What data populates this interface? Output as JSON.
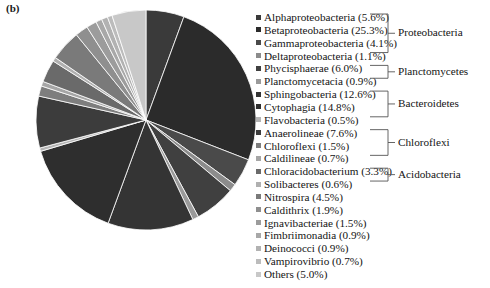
{
  "panel": {
    "label": "(b)"
  },
  "chart_data": {
    "type": "pie",
    "title": "",
    "subtitle": "",
    "xlabel": "",
    "ylabel": "",
    "grid": false,
    "legend_position": "right",
    "start_angle_deg": 0,
    "direction": "clockwise",
    "units": "percent",
    "categories": [
      "Alphaproteobacteria",
      "Betaproteobacteria",
      "Gammaproteobacteria",
      "Deltaproteobacteria",
      "Phycisphaerae",
      "Planctomycetacia",
      "Sphingobacteria",
      "Cytophagia",
      "Flavobacteria",
      "Anaerolineae",
      "Chloroflexi",
      "Caldilineae",
      "Chloracidobacterium",
      "Solibacteres",
      "Nitrospira",
      "Caldithrix",
      "Ignavibacteriae",
      "Fimbriimonadia",
      "Deinococci",
      "Vampirovibrio",
      "Others"
    ],
    "values": [
      5.6,
      25.3,
      4.1,
      1.1,
      6.0,
      0.9,
      12.6,
      14.8,
      0.5,
      7.6,
      1.5,
      0.7,
      3.3,
      0.6,
      4.5,
      1.9,
      1.5,
      0.9,
      0.9,
      0.7,
      5.0
    ],
    "colors": [
      "#3a3a3a",
      "#2b2b2b",
      "#4a4a4a",
      "#8c8c8c",
      "#404040",
      "#9a9a9a",
      "#343434",
      "#2e2e2e",
      "#b4b4b4",
      "#3c3c3c",
      "#7e7e7e",
      "#a6a6a6",
      "#6a6a6a",
      "#b0b0b0",
      "#7a7a7a",
      "#8f8f8f",
      "#9c9c9c",
      "#a8a8a8",
      "#b2b2b2",
      "#bcbcbc",
      "#c8c8c8"
    ]
  },
  "legend": {
    "items": [
      {
        "label": "Alphaproteobacteria (5.6%)",
        "color": "#3a3a3a"
      },
      {
        "label": "Betaproteobacteria (25.3%)",
        "color": "#2b2b2b"
      },
      {
        "label": "Gammaproteobacteria (4.1%)",
        "color": "#4a4a4a"
      },
      {
        "label": "Deltaproteobacteria (1.1%)",
        "color": "#8c8c8c"
      },
      {
        "label": "Phycisphaerae (6.0%)",
        "color": "#404040"
      },
      {
        "label": "Planctomycetacia (0.9%)",
        "color": "#9a9a9a"
      },
      {
        "label": "Sphingobacteria (12.6%)",
        "color": "#343434"
      },
      {
        "label": "Cytophagia (14.8%)",
        "color": "#2e2e2e"
      },
      {
        "label": "Flavobacteria (0.5%)",
        "color": "#b4b4b4"
      },
      {
        "label": "Anaerolineae (7.6%)",
        "color": "#3c3c3c"
      },
      {
        "label": "Chloroflexi (1.5%)",
        "color": "#7e7e7e"
      },
      {
        "label": "Caldilineae (0.7%)",
        "color": "#a6a6a6"
      },
      {
        "label": "Chloracidobacterium (3.3%)",
        "color": "#6a6a6a"
      },
      {
        "label": "Solibacteres (0.6%)",
        "color": "#b0b0b0"
      },
      {
        "label": "Nitrospira (4.5%)",
        "color": "#7a7a7a"
      },
      {
        "label": "Caldithrix (1.9%)",
        "color": "#8f8f8f"
      },
      {
        "label": "Ignavibacteriae (1.5%)",
        "color": "#9c9c9c"
      },
      {
        "label": "Fimbriimonadia (0.9%)",
        "color": "#a8a8a8"
      },
      {
        "label": "Deinococci (0.9%)",
        "color": "#b2b2b2"
      },
      {
        "label": "Vampirovibrio (0.7%)",
        "color": "#bcbcbc"
      },
      {
        "label": "Others (5.0%)",
        "color": "#c8c8c8"
      }
    ]
  },
  "groups": [
    {
      "label": "Proteobacteria",
      "first": 0,
      "last": 3
    },
    {
      "label": "Planctomycetes",
      "first": 4,
      "last": 5
    },
    {
      "label": "Bacteroidetes",
      "first": 6,
      "last": 8
    },
    {
      "label": "Chloroflexi",
      "first": 9,
      "last": 11
    },
    {
      "label": "Acidobacteria",
      "first": 12,
      "last": 13
    }
  ]
}
